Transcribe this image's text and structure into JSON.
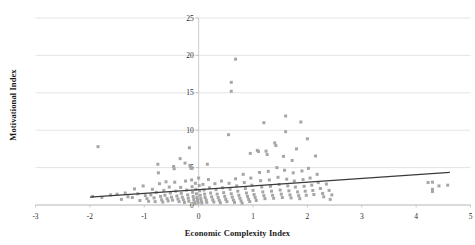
{
  "chart_data": {
    "type": "scatter",
    "title": "",
    "xlabel": "Economic Complexity Index",
    "ylabel": "Motivational Index",
    "xlim": [
      -3,
      5
    ],
    "ylim": [
      0,
      25
    ],
    "xticks": [
      -3,
      -2,
      -1,
      0,
      1,
      2,
      3,
      4,
      5
    ],
    "yticks": [
      0,
      5,
      10,
      15,
      20,
      25
    ],
    "xtick_labels": [
      "-3",
      "-2",
      "-1",
      "0",
      "1",
      "2",
      "3",
      "4",
      "5"
    ],
    "ytick_labels": [
      "0",
      "5",
      "10",
      "15",
      "20",
      "25"
    ],
    "grid": "horizontal",
    "legend": "none",
    "marker": {
      "shape": "square",
      "color": "#a6a6a6",
      "size": 3
    },
    "trendline": {
      "type": "linear",
      "color": "#3a3a3a",
      "x_start": -2.0,
      "y_start": 1.05,
      "x_end": 4.62,
      "y_end": 4.35,
      "slope": 0.498,
      "intercept": 2.05
    },
    "points": [
      [
        -1.85,
        7.8
      ],
      [
        -1.95,
        1.15
      ],
      [
        -1.78,
        1.0
      ],
      [
        -1.62,
        1.35
      ],
      [
        -1.5,
        1.45
      ],
      [
        -1.42,
        0.75
      ],
      [
        -1.35,
        1.6
      ],
      [
        -1.3,
        1.1
      ],
      [
        -1.22,
        1.0
      ],
      [
        -1.18,
        2.15
      ],
      [
        -1.12,
        1.5
      ],
      [
        -1.08,
        0.6
      ],
      [
        -1.02,
        2.55
      ],
      [
        -0.98,
        1.25
      ],
      [
        -0.95,
        0.85
      ],
      [
        -0.92,
        0.5
      ],
      [
        -0.88,
        1.35
      ],
      [
        -0.85,
        2.1
      ],
      [
        -0.82,
        0.95
      ],
      [
        -0.8,
        0.45
      ],
      [
        -0.78,
        1.7
      ],
      [
        -0.75,
        5.45
      ],
      [
        -0.74,
        4.3
      ],
      [
        -0.72,
        2.85
      ],
      [
        -0.7,
        1.15
      ],
      [
        -0.68,
        0.7
      ],
      [
        -0.66,
        0.4
      ],
      [
        -0.64,
        1.95
      ],
      [
        -0.62,
        1.3
      ],
      [
        -0.6,
        3.1
      ],
      [
        -0.58,
        0.85
      ],
      [
        -0.56,
        0.55
      ],
      [
        -0.54,
        2.4
      ],
      [
        -0.52,
        1.6
      ],
      [
        -0.5,
        1.05
      ],
      [
        -0.48,
        0.65
      ],
      [
        -0.46,
        5.15
      ],
      [
        -0.45,
        4.85
      ],
      [
        -0.44,
        3.05
      ],
      [
        -0.42,
        1.85
      ],
      [
        -0.4,
        1.2
      ],
      [
        -0.38,
        0.8
      ],
      [
        -0.36,
        0.45
      ],
      [
        -0.34,
        6.2
      ],
      [
        -0.33,
        2.35
      ],
      [
        -0.32,
        1.55
      ],
      [
        -0.3,
        1.05
      ],
      [
        -0.28,
        0.7
      ],
      [
        -0.26,
        0.35
      ],
      [
        -0.25,
        5.6
      ],
      [
        -0.24,
        3.2
      ],
      [
        -0.22,
        2.0
      ],
      [
        -0.2,
        1.35
      ],
      [
        -0.19,
        0.9
      ],
      [
        -0.18,
        0.5
      ],
      [
        -0.17,
        7.65
      ],
      [
        -0.16,
        5.3
      ],
      [
        -0.15,
        5.1
      ],
      [
        -0.14,
        4.95
      ],
      [
        -0.13,
        3.35
      ],
      [
        -0.12,
        2.45
      ],
      [
        -0.11,
        1.7
      ],
      [
        -0.1,
        1.15
      ],
      [
        -0.09,
        0.75
      ],
      [
        -0.08,
        0.4
      ],
      [
        -0.07,
        0.2
      ],
      [
        -0.06,
        2.9
      ],
      [
        -0.05,
        2.1
      ],
      [
        -0.04,
        1.5
      ],
      [
        -0.03,
        1.0
      ],
      [
        -0.02,
        0.6
      ],
      [
        -0.01,
        0.3
      ],
      [
        0.0,
        3.6
      ],
      [
        0.01,
        2.6
      ],
      [
        0.02,
        1.9
      ],
      [
        0.03,
        1.3
      ],
      [
        0.04,
        0.85
      ],
      [
        0.05,
        0.5
      ],
      [
        0.06,
        0.25
      ],
      [
        0.08,
        2.75
      ],
      [
        0.1,
        2.0
      ],
      [
        0.11,
        1.45
      ],
      [
        0.12,
        1.0
      ],
      [
        0.14,
        0.65
      ],
      [
        0.15,
        0.35
      ],
      [
        0.16,
        5.45
      ],
      [
        0.18,
        3.4
      ],
      [
        0.2,
        2.3
      ],
      [
        0.22,
        1.6
      ],
      [
        0.24,
        1.1
      ],
      [
        0.26,
        0.7
      ],
      [
        0.28,
        0.4
      ],
      [
        0.3,
        2.85
      ],
      [
        0.32,
        2.05
      ],
      [
        0.34,
        1.45
      ],
      [
        0.36,
        1.0
      ],
      [
        0.38,
        0.6
      ],
      [
        0.4,
        0.3
      ],
      [
        0.42,
        3.2
      ],
      [
        0.44,
        2.3
      ],
      [
        0.46,
        1.65
      ],
      [
        0.48,
        1.15
      ],
      [
        0.5,
        0.75
      ],
      [
        0.52,
        0.45
      ],
      [
        0.55,
        9.4
      ],
      [
        0.56,
        2.9
      ],
      [
        0.58,
        2.1
      ],
      [
        0.6,
        1.5
      ],
      [
        0.6,
        16.4
      ],
      [
        0.6,
        15.2
      ],
      [
        0.62,
        1.05
      ],
      [
        0.64,
        0.65
      ],
      [
        0.66,
        0.35
      ],
      [
        0.68,
        19.5
      ],
      [
        0.68,
        3.5
      ],
      [
        0.7,
        2.55
      ],
      [
        0.72,
        1.85
      ],
      [
        0.74,
        1.3
      ],
      [
        0.76,
        0.9
      ],
      [
        0.78,
        0.55
      ],
      [
        0.8,
        0.25
      ],
      [
        0.82,
        4.1
      ],
      [
        0.84,
        3.0
      ],
      [
        0.86,
        2.2
      ],
      [
        0.88,
        1.6
      ],
      [
        0.9,
        1.15
      ],
      [
        0.92,
        0.75
      ],
      [
        0.94,
        0.45
      ],
      [
        0.95,
        6.9
      ],
      [
        0.96,
        3.6
      ],
      [
        0.98,
        2.65
      ],
      [
        1.0,
        1.95
      ],
      [
        1.02,
        1.4
      ],
      [
        1.04,
        1.0
      ],
      [
        1.06,
        0.6
      ],
      [
        1.08,
        7.3
      ],
      [
        1.1,
        7.15
      ],
      [
        1.12,
        4.35
      ],
      [
        1.14,
        3.25
      ],
      [
        1.16,
        2.4
      ],
      [
        1.18,
        1.75
      ],
      [
        1.2,
        11.0
      ],
      [
        1.2,
        1.25
      ],
      [
        1.22,
        0.85
      ],
      [
        1.24,
        7.2
      ],
      [
        1.26,
        6.75
      ],
      [
        1.28,
        4.5
      ],
      [
        1.3,
        3.35
      ],
      [
        1.32,
        2.5
      ],
      [
        1.34,
        1.85
      ],
      [
        1.36,
        1.3
      ],
      [
        1.38,
        0.9
      ],
      [
        1.4,
        8.3
      ],
      [
        1.42,
        7.95
      ],
      [
        1.44,
        5.0
      ],
      [
        1.46,
        3.7
      ],
      [
        1.48,
        2.75
      ],
      [
        1.5,
        2.0
      ],
      [
        1.52,
        1.45
      ],
      [
        1.54,
        1.0
      ],
      [
        1.56,
        6.5
      ],
      [
        1.58,
        4.65
      ],
      [
        1.6,
        11.9
      ],
      [
        1.6,
        9.8
      ],
      [
        1.62,
        3.45
      ],
      [
        1.64,
        2.55
      ],
      [
        1.66,
        1.9
      ],
      [
        1.68,
        1.35
      ],
      [
        1.7,
        0.95
      ],
      [
        1.72,
        5.95
      ],
      [
        1.74,
        4.3
      ],
      [
        1.76,
        3.2
      ],
      [
        1.78,
        2.4
      ],
      [
        1.8,
        7.5
      ],
      [
        1.82,
        1.75
      ],
      [
        1.84,
        1.25
      ],
      [
        1.86,
        0.85
      ],
      [
        1.88,
        11.1
      ],
      [
        1.9,
        4.55
      ],
      [
        1.92,
        3.4
      ],
      [
        1.94,
        2.5
      ],
      [
        1.96,
        1.85
      ],
      [
        1.98,
        1.3
      ],
      [
        2.0,
        8.85
      ],
      [
        2.02,
        4.9
      ],
      [
        2.05,
        3.6
      ],
      [
        2.08,
        2.65
      ],
      [
        2.1,
        1.95
      ],
      [
        2.12,
        1.4
      ],
      [
        2.15,
        6.55
      ],
      [
        2.18,
        4.1
      ],
      [
        2.2,
        3.0
      ],
      [
        2.24,
        2.2
      ],
      [
        2.28,
        1.55
      ],
      [
        2.3,
        1.1
      ],
      [
        2.35,
        2.8
      ],
      [
        2.4,
        1.95
      ],
      [
        2.42,
        0.75
      ],
      [
        2.45,
        1.35
      ],
      [
        4.22,
        3.0
      ],
      [
        4.3,
        3.05
      ],
      [
        4.3,
        2.1
      ],
      [
        4.3,
        1.8
      ],
      [
        4.42,
        2.55
      ],
      [
        4.58,
        2.65
      ]
    ]
  }
}
